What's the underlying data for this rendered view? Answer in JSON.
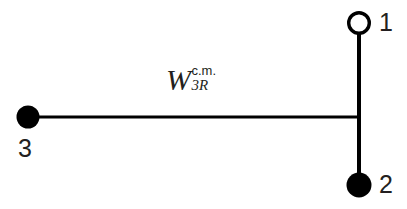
{
  "figure": {
    "background_color": "#ffffff",
    "stroke_color": "#000000",
    "text_color": "#231f20",
    "width": 407,
    "height": 209
  },
  "diagram": {
    "type": "three-body-jacobi-coordinates",
    "nodes": [
      {
        "id": "node-1",
        "label": "1",
        "marker": "open-circle",
        "fill": "#ffffff",
        "stroke": "#000000",
        "cx": 359,
        "cy": 23,
        "r": 11,
        "stroke_width": 3.4
      },
      {
        "id": "node-2",
        "label": "2",
        "marker": "filled-circle",
        "fill": "#000000",
        "stroke": "#000000",
        "cx": 359,
        "cy": 185,
        "r": 12.5,
        "stroke_width": 0
      },
      {
        "id": "node-3",
        "label": "3",
        "marker": "filled-circle",
        "fill": "#000000",
        "stroke": "#000000",
        "cx": 28,
        "cy": 117,
        "r": 11.5,
        "stroke_width": 0
      }
    ],
    "edges": [
      {
        "id": "edge-vertical",
        "from": "node-1",
        "to": "node-2",
        "x1": 359,
        "y1": 34,
        "x2": 359,
        "y2": 185,
        "stroke_width": 4
      },
      {
        "id": "edge-horizontal",
        "from": "node-3",
        "to": "junction",
        "x1": 28,
        "y1": 117,
        "x2": 360,
        "y2": 117,
        "stroke_width": 3.2
      }
    ],
    "junction": {
      "x": 359,
      "y": 117
    },
    "vector_label": {
      "symbol": "W",
      "superscript": "c.m.",
      "subscript": "3R",
      "full_text": "W 3R c.m.",
      "x": 166,
      "y": 64
    }
  },
  "labels": {
    "node_1": "1",
    "node_2": "2",
    "node_3": "3"
  }
}
